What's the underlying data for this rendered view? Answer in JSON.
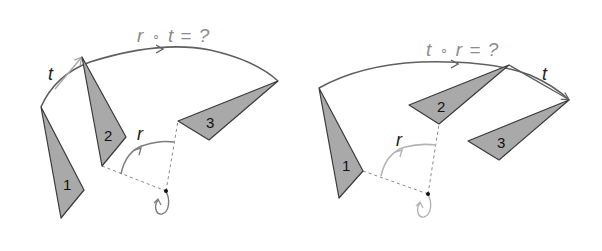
{
  "colors": {
    "background": "#ffffff",
    "triangle_fill": "#a9a9a9",
    "triangle_stroke": "#3a3a3a",
    "arc_stroke": "#5f5f5f",
    "t_arrow_left": "#a8a8a8",
    "t_arrow_right": "#5f5f5f",
    "r_arc_left": "#7d7d7d",
    "r_arc_right": "#b3b3b3",
    "dashed": "#8a8a8a",
    "label_title": "#8c8c8c",
    "pivot": "#111111"
  },
  "left_panel": {
    "title": "r ∘ t = ?",
    "title_parts": {
      "a": "r",
      "op": "∘",
      "b": "t",
      "eq": "=",
      "q": "?"
    },
    "t_label": "t",
    "r_label": "r",
    "triangles": [
      {
        "label": "1",
        "points": "41,107 84,190 61,218",
        "label_x": 66,
        "label_y": 190
      },
      {
        "label": "2",
        "points": "82,57 126,137 102,166",
        "label_x": 107,
        "label_y": 141
      },
      {
        "label": "3",
        "points": "178,121 278,81 209,140",
        "label_x": 210,
        "label_y": 127
      }
    ],
    "pivot": {
      "x": 166,
      "y": 191
    }
  },
  "right_panel": {
    "title": "t ∘ r = ?",
    "title_parts": {
      "a": "t",
      "op": "∘",
      "b": "r",
      "eq": "=",
      "q": "?"
    },
    "t_label": "t",
    "r_label": "r",
    "triangles": [
      {
        "label": "1",
        "points": "319,88 363,171 339,198",
        "label_x": 346,
        "label_y": 170
      },
      {
        "label": "2",
        "points": "409,105 509,65 439,124",
        "label_x": 441,
        "label_y": 112
      },
      {
        "label": "3",
        "points": "468,141 569,100 499,160",
        "label_x": 500,
        "label_y": 147
      }
    ],
    "pivot": {
      "x": 428,
      "y": 194
    }
  }
}
